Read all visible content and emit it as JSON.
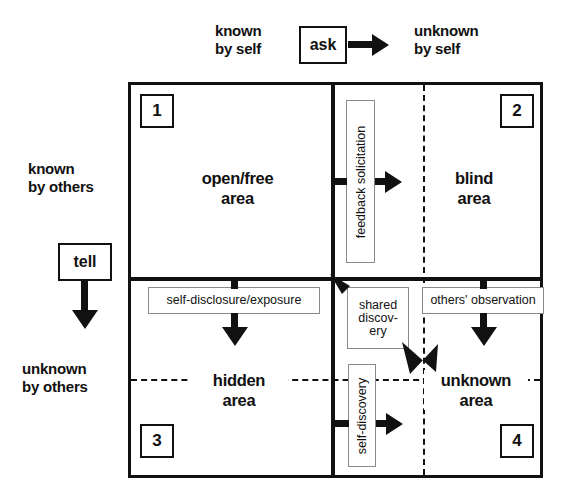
{
  "diagram": {
    "title_axes": {
      "top_left": "known\nby self",
      "top_left_line1": "known",
      "top_left_line2": "by self",
      "top_right_line1": "unknown",
      "top_right_line2": "by self",
      "left_top_line1": "known",
      "left_top_line2": "by others",
      "left_bottom_line1": "unknown",
      "left_bottom_line2": "by others"
    },
    "action_boxes": {
      "ask": "ask",
      "tell": "tell"
    },
    "quadrants": [
      {
        "number": "1",
        "name_line1": "open/free",
        "name_line2": "area"
      },
      {
        "number": "2",
        "name_line1": "blind",
        "name_line2": "area"
      },
      {
        "number": "3",
        "name_line1": "hidden",
        "name_line2": "area"
      },
      {
        "number": "4",
        "name_line1": "unknown",
        "name_line2": "area"
      }
    ],
    "process_labels": {
      "feedback_solicitation": "feedback solicitation",
      "self_disclosure_exposure": "self-disclosure/exposure",
      "shared_discovery_line1": "shared",
      "shared_discovery_line2": "discov-",
      "shared_discovery_line3": "ery",
      "others_observation": "others' observation",
      "self_discovery": "self-discovery"
    },
    "colors": {
      "ink": "#111111",
      "thin_rule": "#8a8a8a",
      "background": "#ffffff"
    }
  }
}
